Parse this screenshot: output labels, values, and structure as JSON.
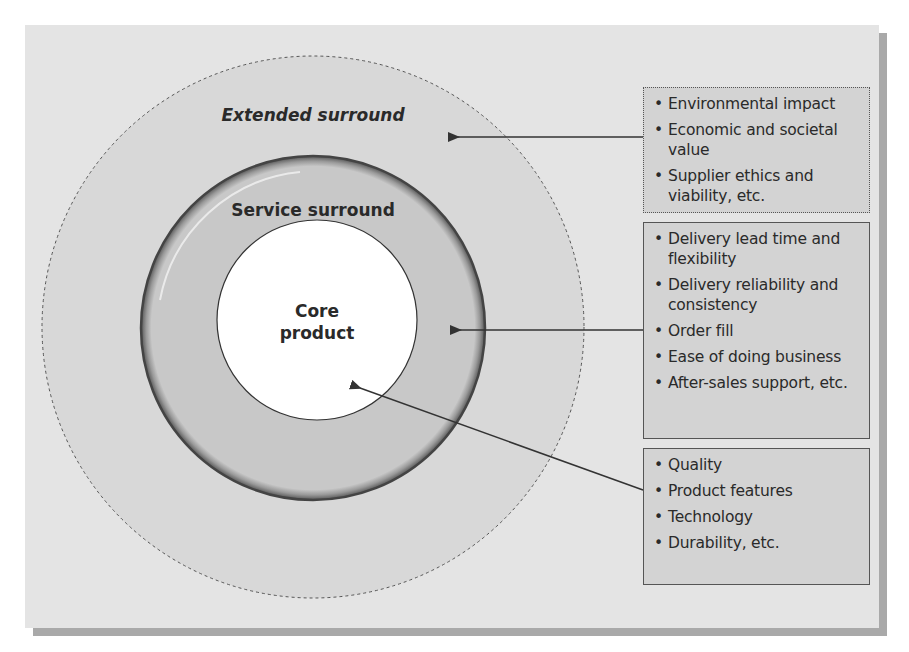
{
  "diagram": {
    "rings": {
      "extended": {
        "label": "Extended surround"
      },
      "service": {
        "label": "Service surround"
      },
      "core": {
        "label_line1": "Core",
        "label_line2": "product"
      }
    },
    "boxes": [
      {
        "id": "extended",
        "items": [
          "Environmental impact",
          "Economic and societal value",
          "Supplier ethics and viability, etc."
        ]
      },
      {
        "id": "service",
        "items": [
          "Delivery lead time and flexibility",
          "Delivery reliability and consistency",
          "Order fill",
          "Ease of doing business",
          "After-sales support, etc."
        ]
      },
      {
        "id": "core",
        "items": [
          "Quality",
          "Product features",
          "Technology",
          "Durability, etc."
        ]
      }
    ],
    "colors": {
      "panel": "#e4e4e4",
      "shadow": "#a9a9a9",
      "extended_fill": "#d8d8d8",
      "service_fill": "#c8c8c8",
      "core_fill": "#ffffff",
      "box_fill": "#d3d3d3",
      "line": "#333333"
    }
  }
}
